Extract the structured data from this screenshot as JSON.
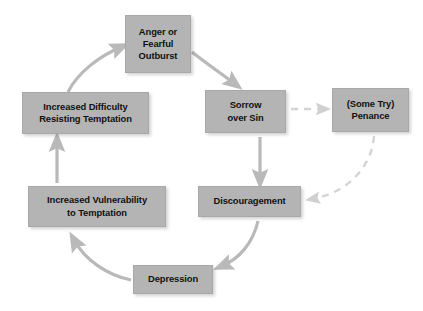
{
  "diagram": {
    "type": "cycle-flowchart",
    "background_color": "#ffffff",
    "node_fill_color": "#b4b4b4",
    "node_text_color": "#111111",
    "arrow_color": "#b9b9b9",
    "dashed_arrow_color": "#d4d4d4",
    "nodes": [
      {
        "id": "anger",
        "label": "Anger or\nFearful\nOutburst"
      },
      {
        "id": "sorrow",
        "label": "Sorrow\nover Sin"
      },
      {
        "id": "penance",
        "label": "(Some Try)\nPenance"
      },
      {
        "id": "discouragement",
        "label": "Discouragement"
      },
      {
        "id": "depression",
        "label": "Depression"
      },
      {
        "id": "vulnerability",
        "label": "Increased Vulnerability\nto Temptation"
      },
      {
        "id": "difficulty",
        "label": "Increased Difficulty\nResisting Temptation"
      }
    ],
    "edges": [
      {
        "from": "anger",
        "to": "sorrow",
        "style": "solid"
      },
      {
        "from": "sorrow",
        "to": "penance",
        "style": "dashed"
      },
      {
        "from": "sorrow",
        "to": "discouragement",
        "style": "solid"
      },
      {
        "from": "penance",
        "to": "discouragement",
        "style": "dashed"
      },
      {
        "from": "discouragement",
        "to": "depression",
        "style": "solid"
      },
      {
        "from": "depression",
        "to": "vulnerability",
        "style": "solid"
      },
      {
        "from": "vulnerability",
        "to": "difficulty",
        "style": "solid"
      },
      {
        "from": "difficulty",
        "to": "anger",
        "style": "solid"
      }
    ]
  }
}
